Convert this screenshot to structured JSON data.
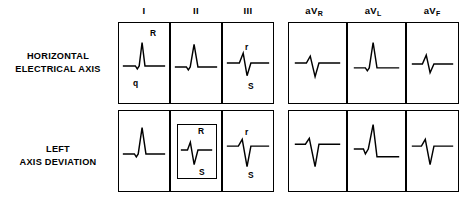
{
  "figure": {
    "row_labels": [
      {
        "id": "horizontal-electrical-axis",
        "line1": "HORIZONTAL",
        "line2": "ELECTRICAL AXIS"
      },
      {
        "id": "left-axis-deviation",
        "line1": "LEFT",
        "line2": "AXIS DEVIATION"
      }
    ],
    "column_groups": [
      {
        "id": "standard-limb-leads",
        "columns": [
          {
            "id": "lead-i",
            "label": "I",
            "sub": ""
          },
          {
            "id": "lead-ii",
            "label": "II",
            "sub": ""
          },
          {
            "id": "lead-iii",
            "label": "III",
            "sub": ""
          }
        ]
      },
      {
        "id": "augmented-limb-leads",
        "columns": [
          {
            "id": "lead-avr",
            "label": "aV",
            "sub": "R"
          },
          {
            "id": "lead-avl",
            "label": "aV",
            "sub": "L"
          },
          {
            "id": "lead-avf",
            "label": "aV",
            "sub": "F"
          }
        ]
      }
    ],
    "cells": [
      {
        "id": "row1-lead-i",
        "row": "horizontal-electrical-axis",
        "lead": "I",
        "annotations": [
          {
            "id": "ann-R",
            "text": "R",
            "x": 31,
            "y": 6
          },
          {
            "id": "ann-q",
            "text": "q",
            "x": 14,
            "y": 56
          }
        ],
        "highlighted": false
      },
      {
        "id": "row1-lead-ii",
        "row": "horizontal-electrical-axis",
        "lead": "II",
        "annotations": [],
        "highlighted": false
      },
      {
        "id": "row1-lead-iii",
        "row": "horizontal-electrical-axis",
        "lead": "III",
        "annotations": [
          {
            "id": "ann-r",
            "text": "r",
            "x": 22,
            "y": 20
          },
          {
            "id": "ann-S",
            "text": "S",
            "x": 25,
            "y": 59
          }
        ],
        "highlighted": false
      },
      {
        "id": "row1-lead-avr",
        "row": "horizontal-electrical-axis",
        "lead": "aVR",
        "annotations": [],
        "highlighted": false
      },
      {
        "id": "row1-lead-avl",
        "row": "horizontal-electrical-axis",
        "lead": "aVL",
        "annotations": [],
        "highlighted": false
      },
      {
        "id": "row1-lead-avf",
        "row": "horizontal-electrical-axis",
        "lead": "aVF",
        "annotations": [],
        "highlighted": false
      },
      {
        "id": "row2-lead-i",
        "row": "left-axis-deviation",
        "lead": "I",
        "annotations": [],
        "highlighted": false
      },
      {
        "id": "row2-lead-ii",
        "row": "left-axis-deviation",
        "lead": "II",
        "annotations": [
          {
            "id": "ann-R",
            "text": "R",
            "x": 26,
            "y": 13
          },
          {
            "id": "ann-S",
            "text": "S",
            "x": 27,
            "y": 52
          }
        ],
        "highlighted": true
      },
      {
        "id": "row2-lead-iii",
        "row": "left-axis-deviation",
        "lead": "III",
        "annotations": [
          {
            "id": "ann-r",
            "text": "r",
            "x": 22,
            "y": 17
          },
          {
            "id": "ann-S",
            "text": "S",
            "x": 25,
            "y": 60
          }
        ],
        "highlighted": false
      },
      {
        "id": "row2-lead-avr",
        "row": "left-axis-deviation",
        "lead": "aVR",
        "annotations": [],
        "highlighted": false
      },
      {
        "id": "row2-lead-avl",
        "row": "left-axis-deviation",
        "lead": "aVL",
        "annotations": [],
        "highlighted": false
      },
      {
        "id": "row2-lead-avf",
        "row": "left-axis-deviation",
        "lead": "aVF",
        "annotations": [],
        "highlighted": false
      }
    ],
    "colors": {
      "ink": "#000000",
      "paper": "#ffffff"
    }
  }
}
